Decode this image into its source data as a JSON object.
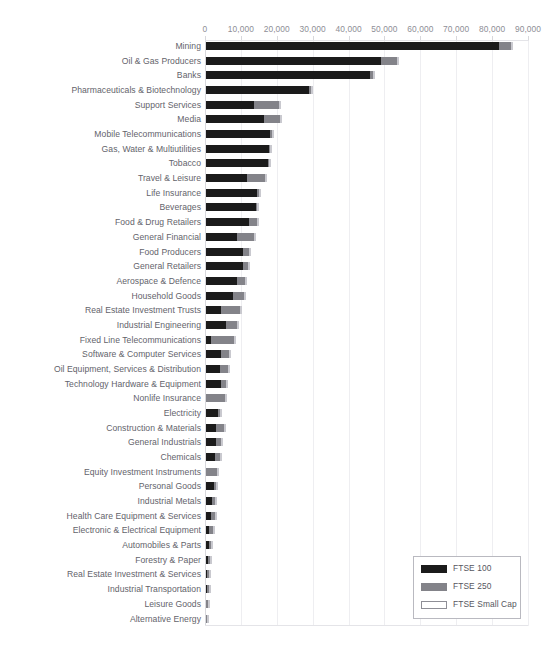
{
  "chart_data": {
    "type": "bar",
    "orientation": "horizontal",
    "stacked": true,
    "title": "",
    "xlabel": "",
    "ylabel": "",
    "xlim": [
      0,
      90000
    ],
    "xticks": [
      0,
      10000,
      20000,
      30000,
      40000,
      50000,
      60000,
      70000,
      80000,
      90000
    ],
    "xticklabels": [
      "0",
      "10,000",
      "20,000",
      "30,000",
      "40,000",
      "50,000",
      "60,000",
      "70,000",
      "80,000",
      "90,000"
    ],
    "grid": true,
    "grid_axis": "x",
    "legend_position": "lower right",
    "legend": [
      "FTSE 100",
      "FTSE 250",
      "FTSE Small Cap"
    ],
    "colors": {
      "FTSE 100": "#1b1b1b",
      "FTSE 250": "#838389",
      "FTSE Small Cap": "#ffffff"
    },
    "categories": [
      "Mining",
      "Oil & Gas Producers",
      "Banks",
      "Pharmaceuticals & Biotechnology",
      "Support Services",
      "Media",
      "Mobile Telecommunications",
      "Gas, Water & Multiutilities",
      "Tobacco",
      "Travel & Leisure",
      "Life Insurance",
      "Beverages",
      "Food & Drug Retailers",
      "General Financial",
      "Food Producers",
      "General Retailers",
      "Aerospace & Defence",
      "Household Goods",
      "Real Estate Investment Trusts",
      "Industrial Engineering",
      "Fixed Line Telecommunications",
      "Software & Computer Services",
      "Oil Equipment, Services & Distribution",
      "Technology Hardware & Equipment",
      "Nonlife Insurance",
      "Electricity",
      "Construction & Materials",
      "General Industrials",
      "Chemicals",
      "Equity Investment Instruments",
      "Personal Goods",
      "Industrial Metals",
      "Health Care Equipment & Services",
      "Electronic & Electrical Equipment",
      "Automobiles & Parts",
      "Forestry & Paper",
      "Real Estate Investment & Services",
      "Industrial Transportation",
      "Leisure Goods",
      "Alternative Energy"
    ],
    "series": [
      {
        "name": "FTSE 100",
        "values": [
          81600,
          48900,
          45600,
          28800,
          13300,
          16200,
          17900,
          17600,
          17200,
          11300,
          14300,
          14000,
          12100,
          8700,
          10300,
          10400,
          8600,
          7600,
          4300,
          5500,
          1500,
          4200,
          3800,
          4100,
          0,
          3400,
          2800,
          2700,
          2500,
          0,
          2100,
          1800,
          1300,
          900,
          900,
          600,
          400,
          300,
          0,
          0
        ]
      },
      {
        "name": "FTSE 250",
        "values": [
          3400,
          4200,
          1000,
          200,
          7000,
          4400,
          500,
          300,
          100,
          5200,
          400,
          300,
          2200,
          4700,
          1700,
          1200,
          2300,
          2900,
          5200,
          3200,
          6200,
          2300,
          2200,
          1400,
          5300,
          600,
          2300,
          1600,
          1500,
          3100,
          700,
          700,
          1100,
          1000,
          600,
          500,
          500,
          500,
          600,
          300
        ]
      },
      {
        "name": "FTSE Small Cap",
        "values": [
          300,
          200,
          100,
          100,
          300,
          200,
          100,
          100,
          100,
          400,
          100,
          100,
          200,
          400,
          200,
          200,
          200,
          300,
          400,
          300,
          300,
          300,
          200,
          200,
          400,
          100,
          200,
          200,
          200,
          300,
          100,
          100,
          200,
          200,
          100,
          100,
          200,
          200,
          100,
          100
        ]
      }
    ]
  },
  "legend": {
    "items": [
      {
        "label": "FTSE 100",
        "swatch": "s100"
      },
      {
        "label": "FTSE 250",
        "swatch": "s250"
      },
      {
        "label": "FTSE Small Cap",
        "swatch": "ssc"
      }
    ]
  },
  "clipped_header": ""
}
